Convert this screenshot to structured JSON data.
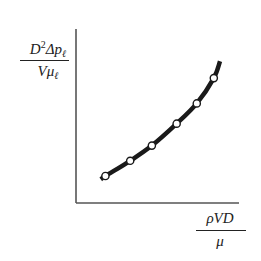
{
  "chart_data": {
    "type": "line",
    "title": "",
    "xlabel": "ρVD/μ",
    "ylabel": "D²Δp_ℓ/(Vμ)",
    "xlabel_parts": {
      "numerator": "ρVD",
      "denominator": "μ"
    },
    "ylabel_parts": {
      "numerator_prefix": "D",
      "numerator_sup": "2",
      "numerator_main": "Δp",
      "numerator_sub": "ℓ",
      "denominator": "Vμ",
      "denominator_sub": "ℓ"
    },
    "grid": false,
    "legend": null,
    "ticks": {
      "x": [],
      "y": []
    },
    "xlim": [
      0,
      10
    ],
    "ylim": [
      0,
      10
    ],
    "series": [
      {
        "name": "data",
        "marker": "open-circle",
        "line": "thick-smooth",
        "x": [
          1.9,
          3.5,
          4.9,
          6.5,
          7.8,
          8.9
        ],
        "y": [
          1.6,
          2.5,
          3.4,
          4.7,
          5.9,
          7.4
        ]
      }
    ],
    "curve_extent": {
      "x": [
        1.6,
        9.3
      ],
      "y": [
        1.4,
        8.4
      ]
    }
  },
  "colors": {
    "axis": "#555555",
    "curve": "#1a1a1a",
    "marker_fill": "#ffffff"
  }
}
